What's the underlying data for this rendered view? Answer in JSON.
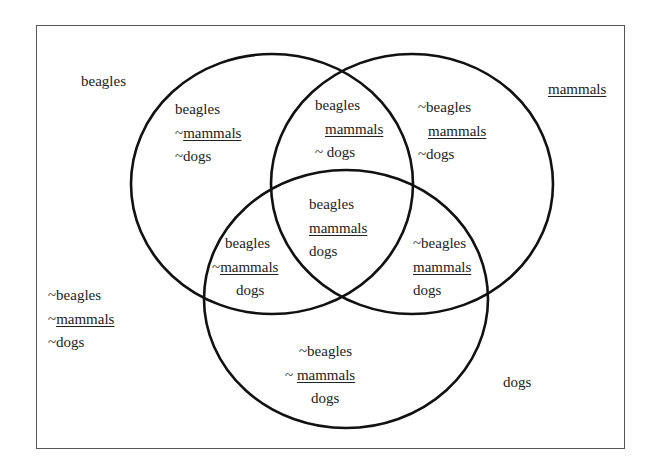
{
  "diagram": {
    "type": "venn-3",
    "sets": [
      {
        "name": "beagles",
        "label": "beagles",
        "cx": 272,
        "cy": 184,
        "rx": 141,
        "ry": 130
      },
      {
        "name": "mammals",
        "label": "mammals",
        "cx": 412,
        "cy": 184,
        "rx": 141,
        "ry": 130
      },
      {
        "name": "dogs",
        "label": "dogs",
        "cx": 346,
        "cy": 299,
        "rx": 142,
        "ry": 129
      }
    ],
    "stroke_color": "#111111",
    "frame_color": "#555555"
  },
  "labels": {
    "outer_beagles": "beagles",
    "outer_mammals": "mammals",
    "outer_dogs": "dogs"
  },
  "regions": {
    "b_only": [
      "beagles",
      "~mammals",
      "~dogs"
    ],
    "bm": [
      "beagles",
      "mammals",
      "~ dogs"
    ],
    "m_only": [
      "~beagles",
      "mammals",
      "~dogs"
    ],
    "bmd": [
      "beagles",
      "mammals",
      "dogs"
    ],
    "bd": [
      "beagles",
      "~mammals",
      "dogs"
    ],
    "md": [
      "~beagles",
      "mammals",
      "dogs"
    ],
    "d_only": [
      "~beagles",
      "~ mammals",
      "dogs"
    ],
    "none": [
      "~beagles",
      "~mammals",
      "~dogs"
    ]
  }
}
